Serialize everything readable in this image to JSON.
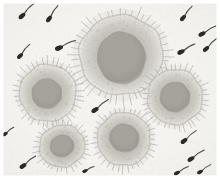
{
  "image": {
    "kind": "brightfield-micrograph",
    "width": 220,
    "height": 179,
    "subject": "oocytes surrounded by spermatozoa",
    "background_color": "#f4f3f0",
    "border_color": "#ffffff",
    "vignette_color": "#e9e8e4",
    "caption": "",
    "grain": {
      "enabled": true,
      "opacity": 0.18,
      "density": 2600,
      "color": "#8e8d89"
    }
  },
  "palette": {
    "background": "#f4f3f0",
    "corona_outer": "#dedcd6",
    "corona_mid": "#cfcdc6",
    "corona_inner": "#c2bfb7",
    "zona": "#b8b5ac",
    "cytoplasm": "#a6a39b",
    "cytoplasm_core": "#9d9a92",
    "spike": "#9a978f",
    "sperm_head": "#2a2a2a",
    "sperm_tail": "#3b3b3b"
  },
  "oocytes": [
    {
      "id": "oocyte-center-top",
      "label": "Oocyte 1",
      "cx": 121,
      "cy": 55,
      "rx": 44,
      "ry": 42,
      "rotation": -8,
      "nucleus_rx": 24,
      "nucleus_ry": 26,
      "nucleus_dx": 0,
      "nucleus_dy": 3,
      "spikes": 46,
      "spike_len": 5.5
    },
    {
      "id": "oocyte-left-mid",
      "label": "Oocyte 2",
      "cx": 48,
      "cy": 93,
      "rx": 30,
      "ry": 30,
      "rotation": 12,
      "nucleus_rx": 15,
      "nucleus_ry": 15,
      "nucleus_dx": -1,
      "nucleus_dy": 1,
      "spikes": 38,
      "spike_len": 4.6
    },
    {
      "id": "oocyte-right-mid",
      "label": "Oocyte 3",
      "cx": 175,
      "cy": 97,
      "rx": 29,
      "ry": 29,
      "rotation": -5,
      "nucleus_rx": 15,
      "nucleus_ry": 15,
      "nucleus_dx": 0,
      "nucleus_dy": 0,
      "spikes": 38,
      "spike_len": 4.6
    },
    {
      "id": "oocyte-center-bottom",
      "label": "Oocyte 4",
      "cx": 124,
      "cy": 139,
      "rx": 28,
      "ry": 28,
      "rotation": 20,
      "nucleus_rx": 15,
      "nucleus_ry": 14,
      "nucleus_dx": 0,
      "nucleus_dy": -1,
      "spikes": 36,
      "spike_len": 4.4
    },
    {
      "id": "oocyte-left-bottom",
      "label": "Oocyte 5",
      "cx": 62,
      "cy": 146,
      "rx": 24,
      "ry": 22,
      "rotation": -14,
      "nucleus_rx": 12,
      "nucleus_ry": 11,
      "nucleus_dx": 0,
      "nucleus_dy": 0,
      "spikes": 32,
      "spike_len": 4.0
    }
  ],
  "sperm": [
    {
      "id": "sperm-01",
      "x": 22,
      "y": 16,
      "angle": -42,
      "len": 17,
      "head": 4.2
    },
    {
      "id": "sperm-02",
      "x": 49,
      "y": 19,
      "angle": -52,
      "len": 16,
      "head": 4.0
    },
    {
      "id": "sperm-03",
      "x": 20,
      "y": 56,
      "angle": -46,
      "len": 15,
      "head": 3.8
    },
    {
      "id": "sperm-04",
      "x": 59,
      "y": 48,
      "angle": -20,
      "len": 18,
      "head": 4.4
    },
    {
      "id": "sperm-05",
      "x": 183,
      "y": 18,
      "angle": -48,
      "len": 15,
      "head": 3.9
    },
    {
      "id": "sperm-06",
      "x": 202,
      "y": 34,
      "angle": -26,
      "len": 16,
      "head": 4.0
    },
    {
      "id": "sperm-07",
      "x": 181,
      "y": 52,
      "angle": -26,
      "len": 16,
      "head": 4.1
    },
    {
      "id": "sperm-08",
      "x": 206,
      "y": 49,
      "angle": -40,
      "len": 15,
      "head": 3.8
    },
    {
      "id": "sperm-09",
      "x": 95,
      "y": 110,
      "angle": -34,
      "len": 17,
      "head": 4.2
    },
    {
      "id": "sperm-10",
      "x": 5,
      "y": 134,
      "angle": -32,
      "len": 11,
      "head": 3.2
    },
    {
      "id": "sperm-11",
      "x": 23,
      "y": 166,
      "angle": -34,
      "len": 16,
      "head": 4.0
    },
    {
      "id": "sperm-12",
      "x": 85,
      "y": 171,
      "angle": -22,
      "len": 10,
      "head": 3.0
    },
    {
      "id": "sperm-13",
      "x": 184,
      "y": 141,
      "angle": -36,
      "len": 16,
      "head": 4.0
    },
    {
      "id": "sperm-14",
      "x": 191,
      "y": 159,
      "angle": -30,
      "len": 16,
      "head": 4.0
    },
    {
      "id": "sperm-15",
      "x": 177,
      "y": 173,
      "angle": -26,
      "len": 13,
      "head": 3.4
    },
    {
      "id": "sperm-16",
      "x": 200,
      "y": 172,
      "angle": -30,
      "len": 13,
      "head": 3.4
    }
  ]
}
